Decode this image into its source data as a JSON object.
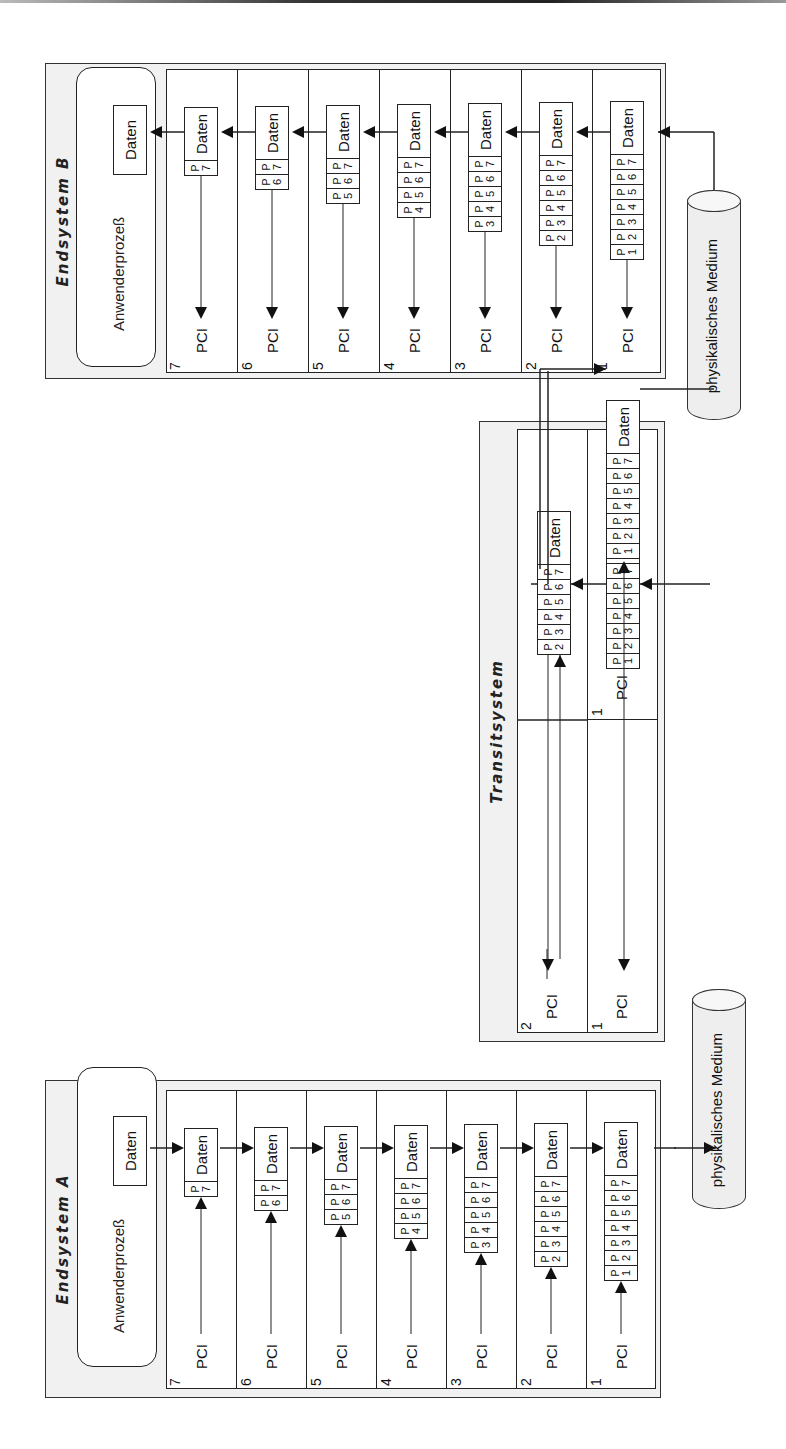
{
  "systems": {
    "a": {
      "title": "Endsystem A",
      "app_label": "Anwenderprozeß",
      "data_label": "Daten"
    },
    "transit": {
      "title": "Transitsystem"
    },
    "b": {
      "title": "Endsystem B",
      "app_label": "Anwenderprozeß",
      "data_label": "Daten"
    }
  },
  "layers": [
    "7",
    "6",
    "5",
    "4",
    "3",
    "2",
    "1"
  ],
  "transit_layers": [
    "2",
    "1"
  ],
  "pci_label": "PCI",
  "data_label": "Daten",
  "medium_label": "physikalisches Medium",
  "pdu_headers": {
    "7": [
      "P7"
    ],
    "6": [
      "P6",
      "P7"
    ],
    "5": [
      "P5",
      "P6",
      "P7"
    ],
    "4": [
      "P4",
      "P5",
      "P6",
      "P7"
    ],
    "3": [
      "P3",
      "P4",
      "P5",
      "P6",
      "P7"
    ],
    "2": [
      "P2",
      "P3",
      "P4",
      "P5",
      "P6",
      "P7"
    ],
    "1": [
      "P1",
      "P2",
      "P3",
      "P4",
      "P5",
      "P6",
      "P7"
    ]
  },
  "colors": {
    "frame_bg": "#f1f1f1",
    "line": "#222222",
    "medium_bg": "#eeeeee"
  }
}
